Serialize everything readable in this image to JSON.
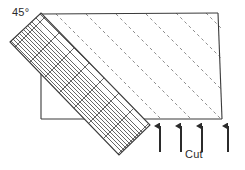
{
  "figure": {
    "type": "technical-diagram",
    "background": "#ffffff",
    "stroke_color": "#3a3a3a",
    "dash_color": "#6e6e6e",
    "hatch_color": "#4a4a4a",
    "width": 245,
    "height": 170
  },
  "labels": {
    "angle": "45°",
    "cut": "Cut"
  },
  "workpiece": {
    "top_edge": {
      "x1": 40,
      "y1": 14,
      "x2": 218,
      "y2": 13
    },
    "left_edge": {
      "x1": 41,
      "y1": 14,
      "x2": 41,
      "y2": 119
    },
    "bottom_edge": {
      "x1": 41,
      "y1": 119,
      "x2": 222,
      "y2": 119
    },
    "right_diagonal": {
      "x1": 218,
      "y1": 13,
      "x2": 222,
      "y2": 119
    }
  },
  "tool_band": {
    "description": "cross-hatched rectangular band oriented at -45 degrees",
    "angle_deg": -45,
    "corners": [
      {
        "x": 10,
        "y": 42
      },
      {
        "x": 41,
        "y": 13
      },
      {
        "x": 150,
        "y": 125
      },
      {
        "x": 119,
        "y": 155
      }
    ],
    "hatch_count": 14,
    "cross_count": 7
  },
  "dashed_passes": {
    "count": 6,
    "angle_deg": -45,
    "origins_on_top_edge": [
      56,
      86,
      116,
      146,
      176,
      206
    ],
    "dash_pattern": "3 3"
  },
  "arrows": {
    "count": 4,
    "direction": "up",
    "tip_y": 124,
    "tail_y": 152,
    "x_positions": [
      160,
      181,
      202,
      228
    ]
  }
}
